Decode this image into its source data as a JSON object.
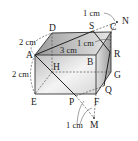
{
  "diagram": {
    "type": "cuboid-geometry",
    "vertices": {
      "A": "A",
      "B": "B",
      "C": "C",
      "D": "D",
      "E": "E",
      "F": "F",
      "G": "G",
      "H": "H",
      "P": "P",
      "Q": "Q",
      "R": "R",
      "S": "S",
      "M": "M",
      "N": "N"
    },
    "dimensions": {
      "AD": "2 cm",
      "AE": "2 cm",
      "AB": "3 cm",
      "CR": "1 cm",
      "CN": "1 cm",
      "FM": "1 cm"
    },
    "colors": {
      "edge": "#333333",
      "face_shade": "#c8c8c8",
      "dashed": "#555555"
    }
  }
}
